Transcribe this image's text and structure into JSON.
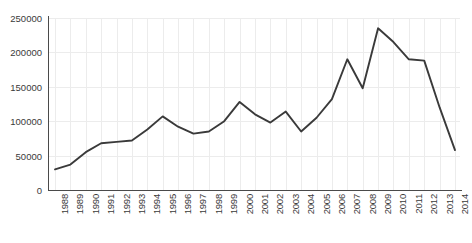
{
  "chart_data": {
    "type": "line",
    "title": "",
    "subtitle": "",
    "xlabel": "",
    "ylabel": "",
    "grid": true,
    "legend": false,
    "legend_position": "none",
    "line_color": "#3a3a3a",
    "grid_color": "#ececec",
    "axis_color": "#4a4a4a",
    "xlim": [
      1988,
      2014
    ],
    "ylim": [
      0,
      250000
    ],
    "ytick_labels": [
      "250000",
      "200000",
      "150000",
      "100000",
      "50000",
      "0"
    ],
    "ytick_values": [
      250000,
      200000,
      150000,
      100000,
      50000,
      0
    ],
    "categories": [
      "1988",
      "1989",
      "1990",
      "1991",
      "1992",
      "1993",
      "1994",
      "1995",
      "1996",
      "1997",
      "1998",
      "1999",
      "2000",
      "2001",
      "2002",
      "2003",
      "2004",
      "2005",
      "2006",
      "2007",
      "2008",
      "2009",
      "2010",
      "2011",
      "2012",
      "2013",
      "2014"
    ],
    "x": [
      1988,
      1989,
      1990,
      1991,
      1992,
      1993,
      1994,
      1995,
      1996,
      1997,
      1998,
      1999,
      2000,
      2001,
      2002,
      2003,
      2004,
      2005,
      2006,
      2007,
      2008,
      2009,
      2010,
      2011,
      2012,
      2013,
      2014
    ],
    "values": [
      30000,
      37000,
      55000,
      68000,
      70000,
      72000,
      88000,
      107000,
      92000,
      82000,
      85000,
      100000,
      128000,
      110000,
      98000,
      114000,
      85000,
      105000,
      132000,
      190000,
      148000,
      235000,
      215000,
      190000,
      188000,
      120000,
      58000
    ],
    "series": [
      {
        "name": "",
        "values": [
          30000,
          37000,
          55000,
          68000,
          70000,
          72000,
          88000,
          107000,
          92000,
          82000,
          85000,
          100000,
          128000,
          110000,
          98000,
          114000,
          85000,
          105000,
          132000,
          190000,
          148000,
          235000,
          215000,
          190000,
          188000,
          120000,
          58000
        ]
      }
    ]
  }
}
